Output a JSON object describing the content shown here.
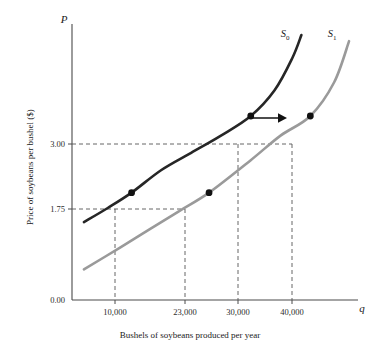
{
  "chart_data": {
    "type": "line",
    "title": "",
    "subtitle": "",
    "xlabel": "Bushels of soybeans produced per year",
    "ylabel": "Price of soybeans per bushel ($)",
    "x_axis_symbol": "q",
    "y_axis_symbol": "P",
    "grid": false,
    "legend_position": "inline-curve-end",
    "xlim": [
      0,
      48000
    ],
    "ylim": [
      0,
      4.5
    ],
    "xticks": [
      10000,
      23000,
      30000,
      40000
    ],
    "xtick_labels": [
      "10,000",
      "23,000",
      "30,000",
      "40,000"
    ],
    "yticks": [
      0.0,
      1.75,
      3.0
    ],
    "ytick_labels": [
      "0.00",
      "1.75",
      "3.00"
    ],
    "series": [
      {
        "name": "S0",
        "label_base": "S",
        "label_sub": "0",
        "color": "#262626",
        "description": "Original supply curve",
        "points": [
          {
            "x": 2000,
            "y": 1.27
          },
          {
            "x": 6000,
            "y": 1.5
          },
          {
            "x": 10000,
            "y": 1.75
          },
          {
            "x": 15000,
            "y": 2.12
          },
          {
            "x": 20000,
            "y": 2.4
          },
          {
            "x": 25000,
            "y": 2.68
          },
          {
            "x": 30000,
            "y": 3.0
          },
          {
            "x": 34000,
            "y": 3.42
          },
          {
            "x": 37000,
            "y": 3.95
          },
          {
            "x": 38500,
            "y": 4.32
          }
        ]
      },
      {
        "name": "S1",
        "label_base": "S",
        "label_sub": "1",
        "color": "#9a9a9a",
        "description": "Supply curve after rightward shift",
        "points": [
          {
            "x": 2000,
            "y": 0.5
          },
          {
            "x": 8000,
            "y": 0.85
          },
          {
            "x": 13000,
            "y": 1.15
          },
          {
            "x": 18000,
            "y": 1.45
          },
          {
            "x": 23000,
            "y": 1.75
          },
          {
            "x": 30000,
            "y": 2.28
          },
          {
            "x": 35000,
            "y": 2.68
          },
          {
            "x": 40000,
            "y": 3.0
          },
          {
            "x": 44000,
            "y": 3.55
          },
          {
            "x": 46500,
            "y": 4.22
          }
        ]
      }
    ],
    "markers": [
      {
        "x": 10000,
        "y": 1.75,
        "series": "S0",
        "label": "point-10000-1.75"
      },
      {
        "x": 23000,
        "y": 1.75,
        "series": "S1",
        "label": "point-23000-1.75"
      },
      {
        "x": 30000,
        "y": 3.0,
        "series": "S0",
        "label": "point-30000-3.00"
      },
      {
        "x": 40000,
        "y": 3.0,
        "series": "S1",
        "label": "point-40000-3.00"
      }
    ],
    "annotations": [
      {
        "type": "arrow",
        "direction": "right",
        "meaning": "supply shift to the right"
      }
    ],
    "dashed_guides": {
      "horizontal": [
        1.75,
        3.0
      ],
      "vertical": [
        10000,
        23000,
        30000,
        40000
      ]
    }
  },
  "labels": {
    "y_axis_symbol": "P",
    "x_axis_symbol": "q",
    "y_axis_caption": "Price of soybeans per bushel ($)",
    "x_axis_caption": "Bushels of soybeans produced per year",
    "ytick_0": "0.00",
    "ytick_175": "1.75",
    "ytick_300": "3.00",
    "xtick_1": "10,000",
    "xtick_2": "23,000",
    "xtick_3": "30,000",
    "xtick_4": "40,000",
    "s0_base": "S",
    "s0_sub": "0",
    "s1_base": "S",
    "s1_sub": "1"
  },
  "colors": {
    "curve_s0": "#262626",
    "curve_s1": "#9a9a9a",
    "axis": "#4a4a4a",
    "dash": "#555555",
    "text": "#1a1a1a",
    "marker": "#111111",
    "background": "#ffffff"
  }
}
